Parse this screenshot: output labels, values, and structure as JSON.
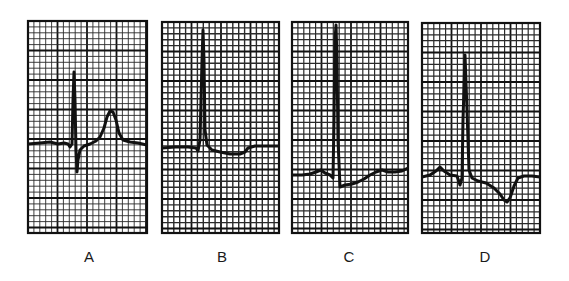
{
  "figure": {
    "background": "#ffffff",
    "grid_color_minor": "#2a2a2a",
    "grid_color_major": "#111111",
    "trace_color": "#111111",
    "minor_cell_px": 5.9,
    "major_every": 5
  },
  "panels": [
    {
      "id": "A",
      "label": "A",
      "label_x": 89,
      "box": {
        "x": 28,
        "y": 21,
        "w": 119,
        "h": 212
      },
      "minor_stroke": 0.9,
      "trace_width": 3,
      "description": "Normal QRS with upright peaked T wave",
      "trace": [
        [
          28,
          144
        ],
        [
          40,
          143
        ],
        [
          50,
          142
        ],
        [
          58,
          144
        ],
        [
          64,
          143
        ],
        [
          68,
          144
        ],
        [
          70,
          147
        ],
        [
          72,
          144
        ],
        [
          73,
          100
        ],
        [
          74,
          72
        ],
        [
          75,
          100
        ],
        [
          76,
          150
        ],
        [
          77,
          172
        ],
        [
          78,
          160
        ],
        [
          80,
          150
        ],
        [
          84,
          146
        ],
        [
          90,
          144
        ],
        [
          96,
          141
        ],
        [
          100,
          137
        ],
        [
          104,
          128
        ],
        [
          107,
          117
        ],
        [
          110,
          111
        ],
        [
          113,
          112
        ],
        [
          116,
          120
        ],
        [
          119,
          133
        ],
        [
          123,
          140
        ],
        [
          130,
          142
        ],
        [
          138,
          143
        ],
        [
          147,
          145
        ]
      ]
    },
    {
      "id": "B",
      "label": "B",
      "label_x": 222,
      "box": {
        "x": 162,
        "y": 22,
        "w": 117,
        "h": 211
      },
      "minor_stroke": 1.4,
      "trace_width": 3,
      "description": "Tall R wave followed by depressed ST segment",
      "trace": [
        [
          162,
          148
        ],
        [
          175,
          147
        ],
        [
          188,
          147
        ],
        [
          196,
          148
        ],
        [
          198,
          151
        ],
        [
          200,
          140
        ],
        [
          202,
          60
        ],
        [
          203,
          30
        ],
        [
          204,
          60
        ],
        [
          205,
          130
        ],
        [
          207,
          145
        ],
        [
          212,
          150
        ],
        [
          220,
          152
        ],
        [
          230,
          154
        ],
        [
          240,
          154
        ],
        [
          245,
          152
        ],
        [
          248,
          148
        ],
        [
          255,
          146
        ],
        [
          265,
          146
        ],
        [
          279,
          146
        ]
      ]
    },
    {
      "id": "C",
      "label": "C",
      "label_x": 349,
      "box": {
        "x": 292,
        "y": 22,
        "w": 116,
        "h": 211
      },
      "minor_stroke": 1.2,
      "trace_width": 3,
      "description": "Tall R wave with ST depression and slow recovery",
      "trace": [
        [
          292,
          175
        ],
        [
          302,
          175
        ],
        [
          310,
          174
        ],
        [
          316,
          172
        ],
        [
          321,
          170
        ],
        [
          325,
          173
        ],
        [
          330,
          175
        ],
        [
          333,
          178
        ],
        [
          334,
          120
        ],
        [
          335,
          40
        ],
        [
          336,
          25
        ],
        [
          337,
          60
        ],
        [
          338,
          140
        ],
        [
          340,
          187
        ],
        [
          345,
          185
        ],
        [
          352,
          184
        ],
        [
          358,
          182
        ],
        [
          364,
          179
        ],
        [
          370,
          175
        ],
        [
          376,
          172
        ],
        [
          382,
          170
        ],
        [
          388,
          172
        ],
        [
          395,
          172
        ],
        [
          402,
          171
        ],
        [
          408,
          168
        ]
      ]
    },
    {
      "id": "D",
      "label": "D",
      "label_x": 485,
      "box": {
        "x": 422,
        "y": 23,
        "w": 118,
        "h": 210
      },
      "minor_stroke": 1.2,
      "trace_width": 3,
      "description": "Tall R wave with downsloping ST segment and inverted T wave",
      "trace": [
        [
          422,
          177
        ],
        [
          430,
          175
        ],
        [
          436,
          171
        ],
        [
          440,
          167
        ],
        [
          444,
          171
        ],
        [
          450,
          175
        ],
        [
          457,
          176
        ],
        [
          460,
          185
        ],
        [
          462,
          178
        ],
        [
          463,
          120
        ],
        [
          465,
          55
        ],
        [
          467,
          110
        ],
        [
          469,
          170
        ],
        [
          472,
          178
        ],
        [
          478,
          181
        ],
        [
          486,
          183
        ],
        [
          494,
          188
        ],
        [
          500,
          194
        ],
        [
          504,
          200
        ],
        [
          507,
          202
        ],
        [
          510,
          198
        ],
        [
          514,
          186
        ],
        [
          518,
          178
        ],
        [
          524,
          176
        ],
        [
          532,
          176
        ],
        [
          540,
          177
        ]
      ]
    }
  ]
}
